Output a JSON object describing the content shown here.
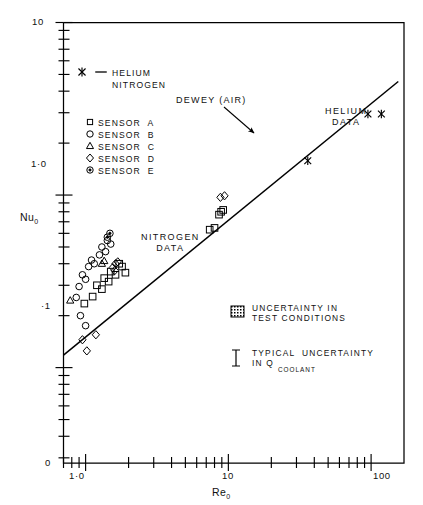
{
  "chart_data": {
    "type": "scatter",
    "title": "",
    "xlabel": "Re_0",
    "ylabel": "Nu_0",
    "xscale": "log",
    "yscale": "log",
    "xlim": [
      0.7,
      170
    ],
    "ylim": [
      0.028,
      10
    ],
    "grid": false,
    "x_tick_labels": [
      "1·0",
      "10",
      "100"
    ],
    "x_tick_values": [
      1,
      10,
      100
    ],
    "y_tick_labels": [
      "10",
      "1·0",
      "·1",
      "0"
    ],
    "y_tick_values": [
      10,
      1.0,
      0.1,
      0.028
    ],
    "legend_position": "upper-left",
    "legend": [
      {
        "marker": "x",
        "label": "HELIUM"
      },
      {
        "marker": "line",
        "label": "NITROGEN"
      },
      {
        "marker": "square",
        "label": "SENSOR  A"
      },
      {
        "marker": "circle",
        "label": "SENSOR  B"
      },
      {
        "marker": "triangle",
        "label": "SENSOR  C"
      },
      {
        "marker": "diamond",
        "label": "SENSOR  D"
      },
      {
        "marker": "dotcircle",
        "label": "SENSOR  E"
      }
    ],
    "annotations": [
      {
        "text": "DEWEY (AIR)",
        "x": 3.1,
        "y": 2.35,
        "arrow_to": [
          6.3,
          1.28
        ]
      },
      {
        "text": "HELIUM\nDATA",
        "x": 52,
        "y": 2.15
      },
      {
        "text": "NITROGEN\nDATA",
        "x": 2.5,
        "y": 0.42
      },
      {
        "text": "UNCERTAINTY IN\nTEST CONDITIONS",
        "x": 12,
        "y": 0.115,
        "marker": "hatchbox"
      },
      {
        "text": "TYPICAL  UNCERTAINTY\nIN Q",
        "subscript": "COOLANT",
        "x": 12,
        "y": 0.062,
        "marker": "ibar"
      }
    ],
    "series": [
      {
        "name": "SENSOR A",
        "marker": "square",
        "points": [
          [
            0.98,
            0.235
          ],
          [
            1.12,
            0.258
          ],
          [
            1.2,
            0.3
          ],
          [
            1.3,
            0.285
          ],
          [
            1.35,
            0.33
          ],
          [
            1.45,
            0.315
          ],
          [
            1.5,
            0.36
          ],
          [
            1.62,
            0.345
          ],
          [
            1.72,
            0.4
          ],
          [
            1.8,
            0.385
          ],
          [
            1.9,
            0.355
          ],
          [
            7.4,
            0.63
          ],
          [
            8.0,
            0.645
          ],
          [
            8.6,
            0.77
          ],
          [
            8.9,
            0.8
          ],
          [
            9.2,
            0.82
          ]
        ]
      },
      {
        "name": "SENSOR B",
        "marker": "circle",
        "points": [
          [
            0.86,
            0.255
          ],
          [
            0.9,
            0.295
          ],
          [
            0.95,
            0.345
          ],
          [
            1.0,
            0.325
          ],
          [
            1.05,
            0.385
          ],
          [
            1.1,
            0.42
          ],
          [
            1.15,
            0.4
          ],
          [
            1.25,
            0.45
          ],
          [
            1.3,
            0.5
          ],
          [
            1.38,
            0.47
          ],
          [
            1.42,
            0.545
          ],
          [
            1.5,
            0.52
          ],
          [
            0.92,
            0.2
          ],
          [
            1.0,
            0.175
          ]
        ]
      },
      {
        "name": "SENSOR C",
        "marker": "triangle",
        "points": [
          [
            0.78,
            0.245
          ],
          [
            1.3,
            0.4
          ],
          [
            1.35,
            0.415
          ]
        ]
      },
      {
        "name": "SENSOR D",
        "marker": "diamond",
        "points": [
          [
            0.95,
            0.145
          ],
          [
            1.02,
            0.125
          ],
          [
            1.18,
            0.155
          ],
          [
            1.55,
            0.38
          ],
          [
            1.6,
            0.365
          ],
          [
            1.62,
            0.4
          ],
          [
            1.68,
            0.41
          ],
          [
            8.8,
            0.97
          ],
          [
            9.4,
            0.99
          ]
        ]
      },
      {
        "name": "SENSOR E",
        "marker": "dotcircle",
        "points": [
          [
            1.42,
            0.57
          ],
          [
            1.48,
            0.6
          ]
        ]
      },
      {
        "name": "HELIUM",
        "marker": "x",
        "points": [
          [
            36,
            1.58
          ],
          [
            95,
            2.95
          ],
          [
            118,
            2.95
          ]
        ]
      }
    ],
    "fit_line": {
      "label": "DEWEY (AIR)",
      "x0": 0.7,
      "y0": 0.118,
      "x1": 155,
      "y1": 4.55
    }
  }
}
